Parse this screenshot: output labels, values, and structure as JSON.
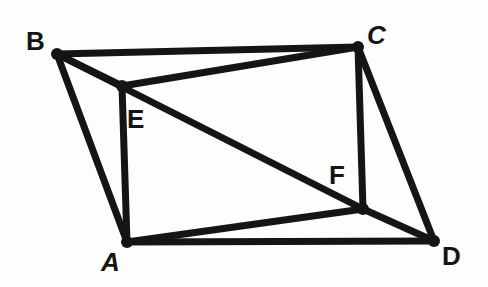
{
  "figure": {
    "type": "geometry-diagram",
    "canvas": {
      "width": 488,
      "height": 287
    },
    "style": {
      "background_color": "#fdfdfd",
      "ink_color": "#151515",
      "stroke_width": 7,
      "vertex_dot_radius": 6
    },
    "vertices": [
      {
        "id": "A",
        "label": "A",
        "x": 127,
        "y": 242,
        "label_x": 101,
        "label_y": 249,
        "italic": true,
        "dot": true
      },
      {
        "id": "B",
        "label": "B",
        "x": 57,
        "y": 54,
        "label_x": 26,
        "label_y": 28,
        "italic": false,
        "dot": true
      },
      {
        "id": "C",
        "label": "C",
        "x": 358,
        "y": 47,
        "label_x": 367,
        "label_y": 22,
        "italic": true,
        "dot": true
      },
      {
        "id": "D",
        "label": "D",
        "x": 434,
        "y": 241,
        "label_x": 442,
        "label_y": 243,
        "italic": false,
        "dot": true
      },
      {
        "id": "E",
        "label": "E",
        "x": 122,
        "y": 86,
        "label_x": 127,
        "label_y": 106,
        "italic": false,
        "dot": true
      },
      {
        "id": "F",
        "label": "F",
        "x": 363,
        "y": 209,
        "label_x": 329,
        "label_y": 162,
        "italic": false,
        "dot": true
      }
    ],
    "edges": [
      {
        "id": "BC",
        "from": "B",
        "to": "C"
      },
      {
        "id": "BE",
        "from": "B",
        "to": "E"
      },
      {
        "id": "EC",
        "from": "E",
        "to": "C"
      },
      {
        "id": "BA",
        "from": "B",
        "to": "A"
      },
      {
        "id": "EA",
        "from": "E",
        "to": "A"
      },
      {
        "id": "BF",
        "from": "B",
        "to": "F"
      },
      {
        "id": "CF",
        "from": "C",
        "to": "F"
      },
      {
        "id": "CD",
        "from": "C",
        "to": "D"
      },
      {
        "id": "AF",
        "from": "A",
        "to": "F"
      },
      {
        "id": "FD",
        "from": "F",
        "to": "D"
      },
      {
        "id": "AD",
        "from": "A",
        "to": "D"
      }
    ]
  }
}
